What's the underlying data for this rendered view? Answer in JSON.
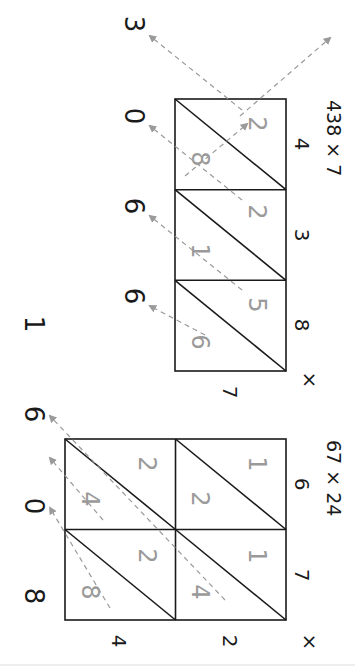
{
  "orientation": "rotated-90-clockwise",
  "colors": {
    "ink": "#1a1a1a",
    "partial_products": "#9a9a9a",
    "guides": "#9a9a9a"
  },
  "problems": [
    {
      "title": "438 × 7",
      "top_digits": [
        "4",
        "3",
        "8"
      ],
      "side_digits": [
        "7"
      ],
      "operator": "×",
      "cells": [
        [
          {
            "tens": "2",
            "ones": "8"
          },
          {
            "tens": "2",
            "ones": "1"
          },
          {
            "tens": "5",
            "ones": "6"
          }
        ]
      ],
      "result_digits": [
        "3",
        "0",
        "6",
        "6"
      ],
      "answer": "3066"
    },
    {
      "title": "67 × 24",
      "top_digits": [
        "6",
        "7"
      ],
      "side_digits": [
        "2",
        "4"
      ],
      "operator": "×",
      "cells": [
        [
          {
            "tens": "1",
            "ones": "2"
          },
          {
            "tens": "1",
            "ones": "4"
          }
        ],
        [
          {
            "tens": "2",
            "ones": "4"
          },
          {
            "tens": "2",
            "ones": "8"
          }
        ]
      ],
      "result_digits": [
        "1",
        "6",
        "0",
        "8"
      ],
      "answer": "1608"
    }
  ]
}
